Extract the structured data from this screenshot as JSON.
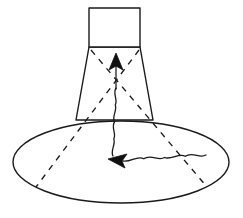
{
  "figure": {
    "background_color": "#ffffff",
    "line_color": "#1a1a1a",
    "canvas": {
      "width": 243,
      "height": 218
    }
  },
  "elements": {
    "source_box": {
      "name": "source-rectangle",
      "x": 89,
      "y": 8,
      "width": 51,
      "height": 39,
      "stroke": "#1a1a1a",
      "fill": "#ffffff"
    },
    "beam_cone": {
      "name": "beam-trapezoid",
      "points": "89,47 140,47 153,120 76,120",
      "stroke": "#1a1a1a",
      "fill": "#ffffff"
    },
    "ground_ellipse": {
      "name": "ground-footprint-ellipse",
      "cx": 121,
      "cy": 162,
      "rx": 108,
      "ry": 41,
      "stroke": "#1a1a1a",
      "fill": "#ffffff"
    },
    "dashed_ray_left": {
      "name": "dashed-ray-left",
      "from_x": 139,
      "from_y": 48,
      "to_x": 35,
      "to_y": 188
    },
    "dashed_ray_right": {
      "name": "dashed-ray-right",
      "from_x": 90,
      "from_y": 48,
      "to_x": 208,
      "to_y": 188
    },
    "up_arrow": {
      "name": "upward-arrow",
      "tip_x": 116,
      "tip_y": 54,
      "base_y": 90,
      "half_width": 7
    },
    "left_arrow": {
      "name": "leftward-arrow",
      "tip_x": 110,
      "tip_y": 160,
      "back_x": 124,
      "half_height": 6
    },
    "wavy_signal": {
      "name": "wavy-signal-path",
      "upper_from_x": 116,
      "upper_from_y": 90,
      "lower_to_x": 113,
      "lower_to_y": 156
    },
    "wavy_ground": {
      "name": "wavy-ground-path",
      "from_x": 124,
      "from_y": 160,
      "to_x": 200,
      "to_y": 155
    }
  },
  "colors": {
    "ink": "#1a1a1a",
    "fill": "#ffffff",
    "arrow": "#101010"
  }
}
